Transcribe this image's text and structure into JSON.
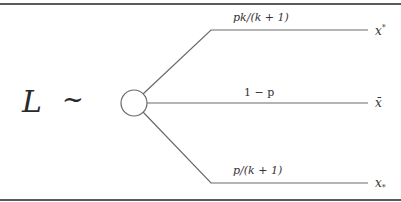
{
  "diagram": {
    "lhs_symbol": "L",
    "relation": "~",
    "node": "chance-node",
    "branches": [
      {
        "probability": "pk/(k + 1)",
        "outcome": "x*"
      },
      {
        "probability": "1 − p",
        "outcome": "x̄"
      },
      {
        "probability": "p/(k + 1)",
        "outcome": "x*"
      }
    ],
    "outcome_labels": {
      "top": "x",
      "top_mark": "*",
      "middle": "x̄",
      "bottom": "x",
      "bottom_mark": "*"
    },
    "colors": {
      "line": "#6a6a6a",
      "text": "#333333",
      "rule": "#5a5a5a"
    }
  }
}
